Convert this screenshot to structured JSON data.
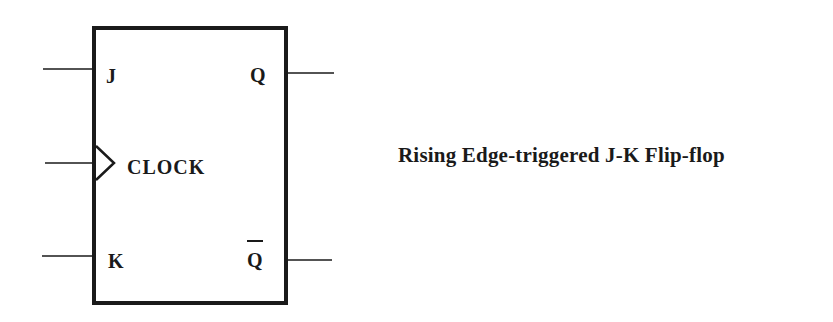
{
  "diagram": {
    "type": "logic-symbol",
    "component": "J-K flip-flop",
    "inputs": [
      {
        "id": "j",
        "label": "J"
      },
      {
        "id": "clock",
        "label": "CLOCK",
        "edge_indicator": "triangle"
      },
      {
        "id": "k",
        "label": "K"
      }
    ],
    "outputs": [
      {
        "id": "q",
        "label": "Q"
      },
      {
        "id": "q-bar",
        "label": "Q",
        "overbar": true
      }
    ],
    "colors": {
      "stroke": "#1a1a1a",
      "background": "#ffffff"
    }
  },
  "caption": "Rising Edge-triggered J-K Flip-flop"
}
